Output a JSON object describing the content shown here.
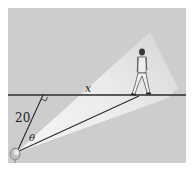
{
  "figure": {
    "labels": {
      "distance_to_path": "20",
      "angle": "θ",
      "walker_distance": "x"
    },
    "colors": {
      "background": "#ffffff",
      "panel": "#cfcfcf",
      "beam": "#ececec",
      "line": "#2a2a2a"
    },
    "objects": {
      "spotlight": "spotlight-icon",
      "walker": "walking-man-figure",
      "right_angle": "right-angle-marker"
    }
  }
}
